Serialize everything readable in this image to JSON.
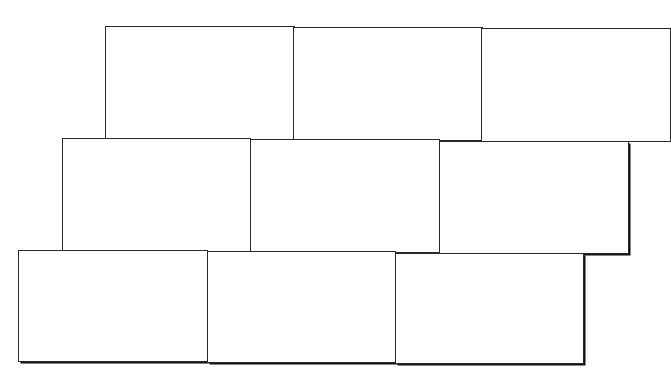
{
  "diagram": {
    "rows": [
      {
        "name": "row-1",
        "box_count": 3,
        "labels": [
          "",
          "",
          ""
        ]
      },
      {
        "name": "row-2",
        "box_count": 3,
        "labels": [
          "",
          "",
          ""
        ]
      },
      {
        "name": "row-3",
        "box_count": 3,
        "labels": [
          "",
          "",
          ""
        ]
      }
    ],
    "colors": {
      "stroke": "#2a2a2a",
      "fill": "#ffffff",
      "background": "#ffffff"
    }
  }
}
